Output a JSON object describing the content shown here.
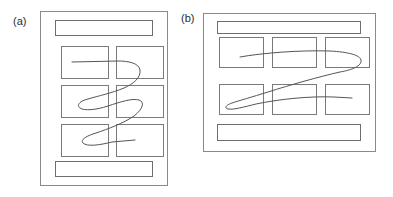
{
  "figure": {
    "type": "line-art-diagram",
    "width": 393,
    "height": 197,
    "background_color": "#ffffff"
  },
  "colors": {
    "frame_stroke": "#8a8a8a",
    "bar_stroke": "#6e6e6e",
    "cell_stroke": "#7a7a7a",
    "path_stroke": "#555555",
    "label_text": "#2b2b2b",
    "number_text": "#1a1a1a",
    "page_fill": "#ffffff"
  },
  "panels": [
    {
      "id": "a",
      "label": "(a)",
      "orientation": "portrait",
      "grid": {
        "columns": 2,
        "rows": 3
      },
      "path_type": "vertical-serpentine",
      "top_bar": {
        "label": ""
      },
      "bottom_bar": {
        "label": ""
      },
      "cells": [
        {
          "number": "1",
          "row": 1,
          "column": 1
        },
        {
          "number": "2",
          "row": 1,
          "column": 2
        },
        {
          "number": "3",
          "row": 2,
          "column": 1
        },
        {
          "number": "4",
          "row": 2,
          "column": 2
        },
        {
          "number": "5",
          "row": 3,
          "column": 1
        },
        {
          "number": "6",
          "row": 3,
          "column": 2
        }
      ],
      "path_order": [
        "1",
        "2",
        "3",
        "4",
        "5",
        "6"
      ]
    },
    {
      "id": "b",
      "label": "(b)",
      "orientation": "landscape",
      "grid": {
        "columns": 3,
        "rows": 2
      },
      "path_type": "horizontal-zigzag",
      "top_bar": {
        "label": ""
      },
      "bottom_bar": {
        "label": ""
      },
      "cells": [
        {
          "number": "1",
          "row": 1,
          "column": 1
        },
        {
          "number": "2",
          "row": 1,
          "column": 2
        },
        {
          "number": "3",
          "row": 1,
          "column": 3
        },
        {
          "number": "4",
          "row": 2,
          "column": 1
        },
        {
          "number": "5",
          "row": 2,
          "column": 2
        },
        {
          "number": "6",
          "row": 2,
          "column": 3
        }
      ],
      "path_order": [
        "1",
        "2",
        "3",
        "4",
        "5",
        "6"
      ]
    }
  ]
}
